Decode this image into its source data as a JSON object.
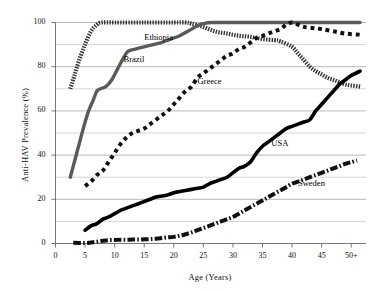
{
  "chart_data": {
    "type": "line",
    "title": "",
    "xlabel": "Age (Years)",
    "ylabel": "Anti-HAV Prevalence (%)",
    "xlim": [
      0,
      52.5
    ],
    "ylim": [
      0,
      100
    ],
    "xticks": [
      0,
      5,
      10,
      15,
      20,
      25,
      30,
      35,
      40,
      45,
      50
    ],
    "xticklabels": [
      "0",
      "5",
      "10",
      "15",
      "20",
      "25",
      "30",
      "35",
      "40",
      "45",
      "50+"
    ],
    "yticks": [
      0,
      20,
      40,
      60,
      80,
      100
    ],
    "yticklabels": [
      "0",
      "20",
      "40",
      "60",
      "80",
      "100"
    ],
    "y_minor_gridlines": [
      10,
      30,
      50,
      70,
      90
    ],
    "grid": "horizontal-major-and-minor",
    "legend": "inline-labels",
    "series": [
      {
        "name": "Ethiopia",
        "style": "fine-hatched-dotted",
        "color": "#333333",
        "width": 4.2,
        "label_x": 15.0,
        "label_y": 93.0,
        "points": [
          [
            2.5,
            70
          ],
          [
            3.2,
            76
          ],
          [
            4.0,
            83
          ],
          [
            5.0,
            90
          ],
          [
            6.0,
            96
          ],
          [
            7.0,
            99
          ],
          [
            7.8,
            100
          ],
          [
            10,
            100
          ],
          [
            15,
            100
          ],
          [
            20,
            100
          ],
          [
            22,
            100
          ],
          [
            23,
            99.5
          ],
          [
            25,
            98
          ],
          [
            27,
            96
          ],
          [
            29,
            95
          ],
          [
            31,
            94
          ],
          [
            33,
            93.5
          ],
          [
            35,
            92.5
          ],
          [
            37,
            92
          ],
          [
            38,
            91.5
          ],
          [
            40,
            89
          ],
          [
            41,
            86
          ],
          [
            42,
            83
          ],
          [
            43,
            80
          ],
          [
            44,
            78
          ],
          [
            45,
            76.5
          ],
          [
            46,
            75
          ],
          [
            47,
            74
          ],
          [
            48,
            73
          ],
          [
            49,
            72
          ],
          [
            50,
            71.5
          ],
          [
            51.5,
            71
          ]
        ]
      },
      {
        "name": "Brazil",
        "style": "solid-gray",
        "color": "#5a5a5a",
        "width": 3.4,
        "label_x": 11.5,
        "label_y": 83.0,
        "points": [
          [
            2.5,
            30
          ],
          [
            3.2,
            37
          ],
          [
            4.0,
            45
          ],
          [
            4.8,
            53
          ],
          [
            5.6,
            60
          ],
          [
            6.4,
            65
          ],
          [
            7.0,
            69
          ],
          [
            7.6,
            70
          ],
          [
            8.5,
            71
          ],
          [
            9.5,
            74
          ],
          [
            10.5,
            79
          ],
          [
            11.5,
            84
          ],
          [
            12.3,
            87
          ],
          [
            13.5,
            88
          ],
          [
            15,
            89
          ],
          [
            16.5,
            90
          ],
          [
            18,
            91
          ],
          [
            19.5,
            92.5
          ],
          [
            21,
            94
          ],
          [
            22,
            95.5
          ],
          [
            23,
            97
          ],
          [
            24,
            98.5
          ],
          [
            25,
            99.5
          ],
          [
            26.5,
            100
          ],
          [
            30,
            100
          ],
          [
            35,
            100
          ],
          [
            40,
            100
          ],
          [
            45,
            100
          ],
          [
            51.5,
            100
          ]
        ]
      },
      {
        "name": "Greece",
        "style": "square-dotted",
        "color": "#111111",
        "width": 4.0,
        "label_x": 24.0,
        "label_y": 73.0,
        "points": [
          [
            5.0,
            26
          ],
          [
            6.0,
            28
          ],
          [
            7.0,
            31
          ],
          [
            8.0,
            33
          ],
          [
            9.0,
            37
          ],
          [
            10.0,
            41
          ],
          [
            11.0,
            45
          ],
          [
            12.0,
            48
          ],
          [
            13.0,
            50
          ],
          [
            14.0,
            51
          ],
          [
            15.0,
            52
          ],
          [
            16.0,
            54
          ],
          [
            17.0,
            56
          ],
          [
            18.0,
            58
          ],
          [
            19.0,
            60
          ],
          [
            20.0,
            63
          ],
          [
            21.0,
            66
          ],
          [
            22.0,
            69
          ],
          [
            23.0,
            71
          ],
          [
            24.0,
            75
          ],
          [
            25.0,
            77
          ],
          [
            26.0,
            79
          ],
          [
            27.0,
            81
          ],
          [
            28.0,
            83
          ],
          [
            29.0,
            85
          ],
          [
            30.0,
            86
          ],
          [
            31.0,
            88
          ],
          [
            32.0,
            89
          ],
          [
            33.0,
            91
          ],
          [
            34.0,
            93
          ],
          [
            35.0,
            94
          ],
          [
            36.0,
            95
          ],
          [
            37.0,
            96
          ],
          [
            38.0,
            97
          ],
          [
            39.0,
            99
          ],
          [
            40.0,
            100
          ],
          [
            41.0,
            99
          ],
          [
            42.0,
            98
          ],
          [
            43.5,
            97.5
          ],
          [
            45.0,
            97
          ],
          [
            47.0,
            96
          ],
          [
            49.0,
            95
          ],
          [
            51.5,
            94.5
          ]
        ]
      },
      {
        "name": "USA",
        "style": "solid-black",
        "color": "#000000",
        "width": 3.6,
        "label_x": 36.5,
        "label_y": 45.0,
        "points": [
          [
            5.0,
            6
          ],
          [
            6.0,
            8
          ],
          [
            7.0,
            9
          ],
          [
            8.0,
            11
          ],
          [
            9.0,
            12
          ],
          [
            10.0,
            13.5
          ],
          [
            11.0,
            15
          ],
          [
            12.0,
            16
          ],
          [
            13.0,
            17
          ],
          [
            14.0,
            18
          ],
          [
            15.0,
            19
          ],
          [
            16.0,
            20
          ],
          [
            17.0,
            21
          ],
          [
            18.0,
            21.5
          ],
          [
            19.0,
            22
          ],
          [
            20.0,
            23
          ],
          [
            21.0,
            23.5
          ],
          [
            22.0,
            24
          ],
          [
            23.0,
            24.5
          ],
          [
            24.0,
            25
          ],
          [
            25.0,
            25.5
          ],
          [
            26.0,
            27
          ],
          [
            27.0,
            28
          ],
          [
            28.0,
            29
          ],
          [
            29.0,
            30
          ],
          [
            30.0,
            32
          ],
          [
            31.0,
            34
          ],
          [
            32.0,
            35
          ],
          [
            33.0,
            37
          ],
          [
            34.0,
            41
          ],
          [
            35.0,
            44
          ],
          [
            36.0,
            46
          ],
          [
            37.0,
            48
          ],
          [
            38.0,
            50
          ],
          [
            39.0,
            52
          ],
          [
            40.0,
            53
          ],
          [
            41.0,
            54
          ],
          [
            42.0,
            55
          ],
          [
            43.0,
            56
          ],
          [
            44.0,
            60
          ],
          [
            45.0,
            63
          ],
          [
            46.0,
            66
          ],
          [
            47.0,
            69
          ],
          [
            48.0,
            72
          ],
          [
            49.0,
            74
          ],
          [
            50.0,
            76
          ],
          [
            51.5,
            78
          ]
        ]
      },
      {
        "name": "Sweden",
        "style": "dash-dot",
        "color": "#111111",
        "width": 4.0,
        "label_x": 41.0,
        "label_y": 27.0,
        "points": [
          [
            3.0,
            0.3
          ],
          [
            5.0,
            0.2
          ],
          [
            6.0,
            0.5
          ],
          [
            7.0,
            0.8
          ],
          [
            8.0,
            1.2
          ],
          [
            9.0,
            1.5
          ],
          [
            10.0,
            1.6
          ],
          [
            11.0,
            1.7
          ],
          [
            12.0,
            1.7
          ],
          [
            13.0,
            1.8
          ],
          [
            14.0,
            1.8
          ],
          [
            15.0,
            1.9
          ],
          [
            16.0,
            2.0
          ],
          [
            17.0,
            2.2
          ],
          [
            18.0,
            2.5
          ],
          [
            19.0,
            2.8
          ],
          [
            20.0,
            3.0
          ],
          [
            21.0,
            3.5
          ],
          [
            22.0,
            4.2
          ],
          [
            23.0,
            5.0
          ],
          [
            24.0,
            6.0
          ],
          [
            25.0,
            7.0
          ],
          [
            26.0,
            8.0
          ],
          [
            27.0,
            9.0
          ],
          [
            28.0,
            10.0
          ],
          [
            29.0,
            11.0
          ],
          [
            30.0,
            12.0
          ],
          [
            31.0,
            13.5
          ],
          [
            32.0,
            15.0
          ],
          [
            33.0,
            16.5
          ],
          [
            34.0,
            18.0
          ],
          [
            35.0,
            19.5
          ],
          [
            36.0,
            21.0
          ],
          [
            37.0,
            22.5
          ],
          [
            38.0,
            24.0
          ],
          [
            39.0,
            25.5
          ],
          [
            40.0,
            27.0
          ],
          [
            41.0,
            28.0
          ],
          [
            42.0,
            29.0
          ],
          [
            43.0,
            30.0
          ],
          [
            44.0,
            31.0
          ],
          [
            45.0,
            32.0
          ],
          [
            46.0,
            33.0
          ],
          [
            47.0,
            34.0
          ],
          [
            48.0,
            35.0
          ],
          [
            49.0,
            36.0
          ],
          [
            50.0,
            36.8
          ],
          [
            51.0,
            37.5
          ]
        ]
      }
    ]
  },
  "axes": {
    "x_title": "Age (Years)",
    "y_title": "Anti-HAV Prevalence (%)"
  }
}
